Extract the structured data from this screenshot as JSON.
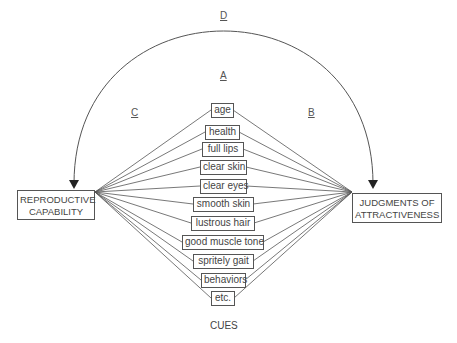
{
  "diagram": {
    "left_node": {
      "line1": "REPRODUCTIVE",
      "line2": "CAPABILITY"
    },
    "right_node": {
      "line1": "JUDGMENTS OF",
      "line2": "ATTRACTIVENESS"
    },
    "path_labels": {
      "A": "A",
      "B": "B",
      "C": "C",
      "D": "D"
    },
    "cues_title": "CUES",
    "cues": [
      {
        "label": "age"
      },
      {
        "label": "health"
      },
      {
        "label": "full lips"
      },
      {
        "label": "clear skin"
      },
      {
        "label": "clear eyes"
      },
      {
        "label": "smooth skin"
      },
      {
        "label": "lustrous hair"
      },
      {
        "label": "good muscle tone"
      },
      {
        "label": "spritely gait"
      },
      {
        "label": "behaviors"
      },
      {
        "label": "etc."
      }
    ]
  }
}
